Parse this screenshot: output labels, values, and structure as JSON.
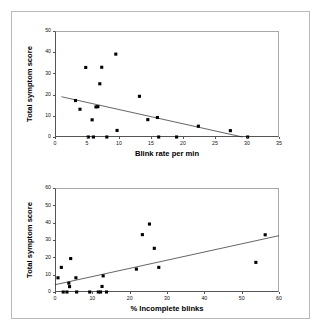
{
  "figure": {
    "background_color": "#ffffff",
    "frame_color": "#b9b9b9",
    "marker_color": "#000000",
    "axis_color": "#555555"
  },
  "chart_data": [
    {
      "type": "scatter",
      "id": "blink-rate-vs-symptom-score",
      "title": "",
      "xlabel": "Blink rate per min",
      "ylabel": "Total symptom score",
      "xlim": [
        0,
        35
      ],
      "ylim": [
        0,
        50
      ],
      "xticks": [
        0,
        5,
        10,
        15,
        20,
        25,
        30,
        35
      ],
      "yticks": [
        0,
        10,
        20,
        30,
        40,
        50
      ],
      "grid": false,
      "legend": null,
      "points": [
        {
          "x": 3.2,
          "y": 17.2
        },
        {
          "x": 3.9,
          "y": 13.1
        },
        {
          "x": 4.8,
          "y": 32.8
        },
        {
          "x": 5.2,
          "y": 0.0
        },
        {
          "x": 5.8,
          "y": 8.1
        },
        {
          "x": 6.0,
          "y": 0.0
        },
        {
          "x": 6.4,
          "y": 14.2
        },
        {
          "x": 6.7,
          "y": 14.3
        },
        {
          "x": 7.0,
          "y": 25.1
        },
        {
          "x": 7.3,
          "y": 32.9
        },
        {
          "x": 8.1,
          "y": 0.0
        },
        {
          "x": 9.5,
          "y": 39.1
        },
        {
          "x": 9.7,
          "y": 3.1
        },
        {
          "x": 13.2,
          "y": 19.2
        },
        {
          "x": 14.5,
          "y": 8.2
        },
        {
          "x": 16.0,
          "y": 9.2
        },
        {
          "x": 16.2,
          "y": 0.0
        },
        {
          "x": 19.0,
          "y": 0.0
        },
        {
          "x": 22.4,
          "y": 5.1
        },
        {
          "x": 27.4,
          "y": 3.0
        },
        {
          "x": 30.1,
          "y": 0.0
        }
      ],
      "fit_line": {
        "x1": 1.0,
        "y1": 19.0,
        "x2": 29.3,
        "y2": 0.0
      }
    },
    {
      "type": "scatter",
      "id": "incomplete-blinks-vs-symptom-score",
      "title": "",
      "xlabel": "% Incomplete blinks",
      "ylabel": "Total symptom score",
      "xlim": [
        0,
        60
      ],
      "ylim": [
        0,
        60
      ],
      "xticks": [
        0,
        10,
        20,
        30,
        40,
        50,
        60
      ],
      "yticks": [
        0,
        10,
        20,
        30,
        40,
        50,
        60
      ],
      "grid": false,
      "legend": null,
      "points": [
        {
          "x": 0.8,
          "y": 8.2
        },
        {
          "x": 1.7,
          "y": 14.2
        },
        {
          "x": 2.2,
          "y": 0.0
        },
        {
          "x": 3.2,
          "y": 0.0
        },
        {
          "x": 3.7,
          "y": 5.1
        },
        {
          "x": 3.9,
          "y": 3.1
        },
        {
          "x": 4.2,
          "y": 19.3
        },
        {
          "x": 5.6,
          "y": 8.2
        },
        {
          "x": 5.8,
          "y": 0.0
        },
        {
          "x": 9.3,
          "y": 0.0
        },
        {
          "x": 11.6,
          "y": 0.0
        },
        {
          "x": 12.2,
          "y": 0.0
        },
        {
          "x": 12.6,
          "y": 3.2
        },
        {
          "x": 12.9,
          "y": 9.3
        },
        {
          "x": 13.8,
          "y": 0.0
        },
        {
          "x": 21.8,
          "y": 13.2
        },
        {
          "x": 23.4,
          "y": 33.1
        },
        {
          "x": 25.3,
          "y": 39.2
        },
        {
          "x": 26.6,
          "y": 25.2
        },
        {
          "x": 27.8,
          "y": 14.2
        },
        {
          "x": 53.8,
          "y": 17.1
        },
        {
          "x": 56.3,
          "y": 33.0
        }
      ],
      "fit_line": {
        "x1": 0.0,
        "y1": 4.2,
        "x2": 60.0,
        "y2": 32.5
      }
    }
  ]
}
